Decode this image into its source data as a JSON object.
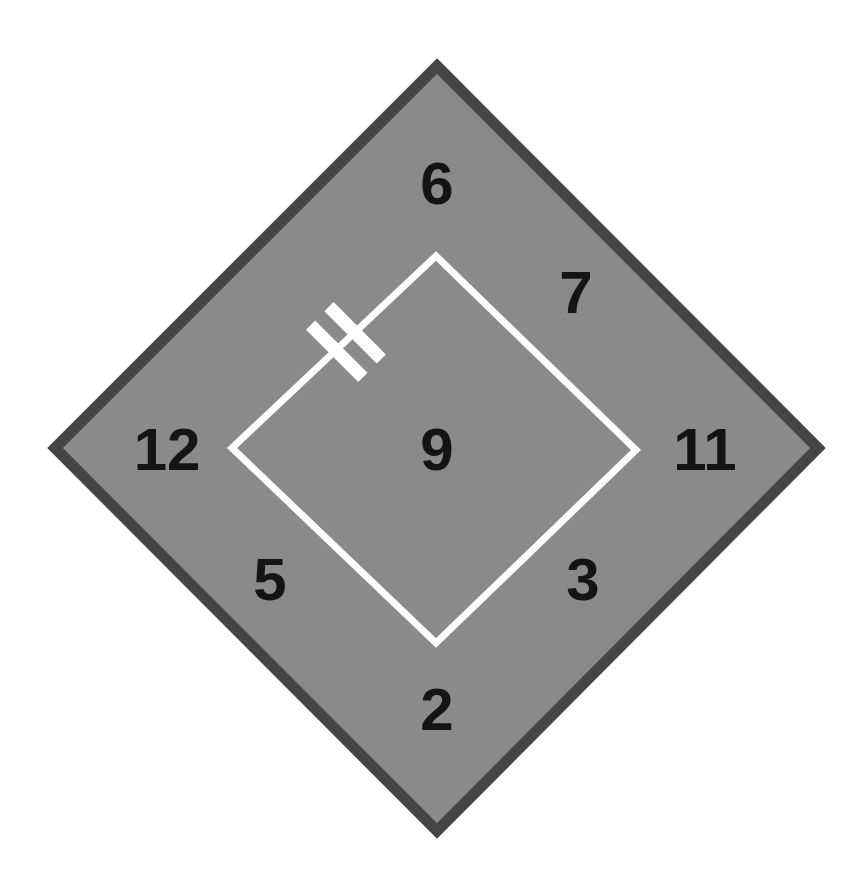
{
  "figure": {
    "background_color": "#ffffff",
    "outer_shape": {
      "name": "outer-diamond",
      "shape": "square-rotated-45",
      "fill_color": "#8a8a8a",
      "border_color": "#454545",
      "border_width_px": 11,
      "vertices": {
        "top": [
          437,
          66
        ],
        "right": [
          818,
          448
        ],
        "bottom": [
          437,
          831
        ],
        "left": [
          55,
          448
        ]
      }
    },
    "inner_shape": {
      "name": "inner-diamond",
      "shape": "square-rotated-45",
      "fill_color": "none",
      "stroke_color": "#ffffff",
      "stroke_width_px": 7,
      "vertices": {
        "top": [
          436,
          256
        ],
        "right": [
          636,
          450
        ],
        "bottom": [
          436,
          643
        ],
        "left": [
          232,
          448
        ]
      }
    },
    "marker": {
      "name": "double-bar-marker",
      "description": "two parallel white bars crossing the upper-left edge of the inner diamond",
      "color": "#ffffff",
      "bar_count": 2,
      "bar_length_px": 74,
      "bar_thickness_px": 13,
      "position": [
        341,
        347
      ],
      "rotation_deg": -45
    },
    "labels": [
      {
        "id": "label-6",
        "text": "6",
        "x": 437,
        "y": 184,
        "font_size_px": 60,
        "color": "#141414",
        "position_name": "top"
      },
      {
        "id": "label-7",
        "text": "7",
        "x": 576,
        "y": 293,
        "font_size_px": 60,
        "color": "#141414",
        "position_name": "upper-right"
      },
      {
        "id": "label-12",
        "text": "12",
        "x": 167,
        "y": 450,
        "font_size_px": 60,
        "color": "#141414",
        "position_name": "left"
      },
      {
        "id": "label-11",
        "text": "11",
        "x": 705,
        "y": 450,
        "font_size_px": 60,
        "color": "#141414",
        "position_name": "right"
      },
      {
        "id": "label-9",
        "text": "9",
        "x": 437,
        "y": 450,
        "font_size_px": 60,
        "color": "#141414",
        "position_name": "center"
      },
      {
        "id": "label-5",
        "text": "5",
        "x": 270,
        "y": 580,
        "font_size_px": 60,
        "color": "#141414",
        "position_name": "lower-left"
      },
      {
        "id": "label-3",
        "text": "3",
        "x": 583,
        "y": 580,
        "font_size_px": 60,
        "color": "#141414",
        "position_name": "lower-right"
      },
      {
        "id": "label-2",
        "text": "2",
        "x": 437,
        "y": 710,
        "font_size_px": 60,
        "color": "#141414",
        "position_name": "bottom"
      }
    ]
  }
}
